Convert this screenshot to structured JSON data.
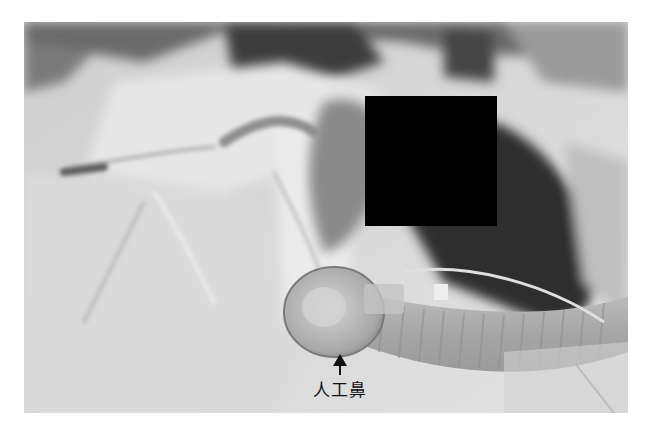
{
  "figure": {
    "colors": {
      "background": "#ffffff",
      "redaction": "#000000",
      "label_text": "#111111"
    },
    "annotation": {
      "label": "人工鼻",
      "arrow": "up-arrow-icon"
    }
  }
}
